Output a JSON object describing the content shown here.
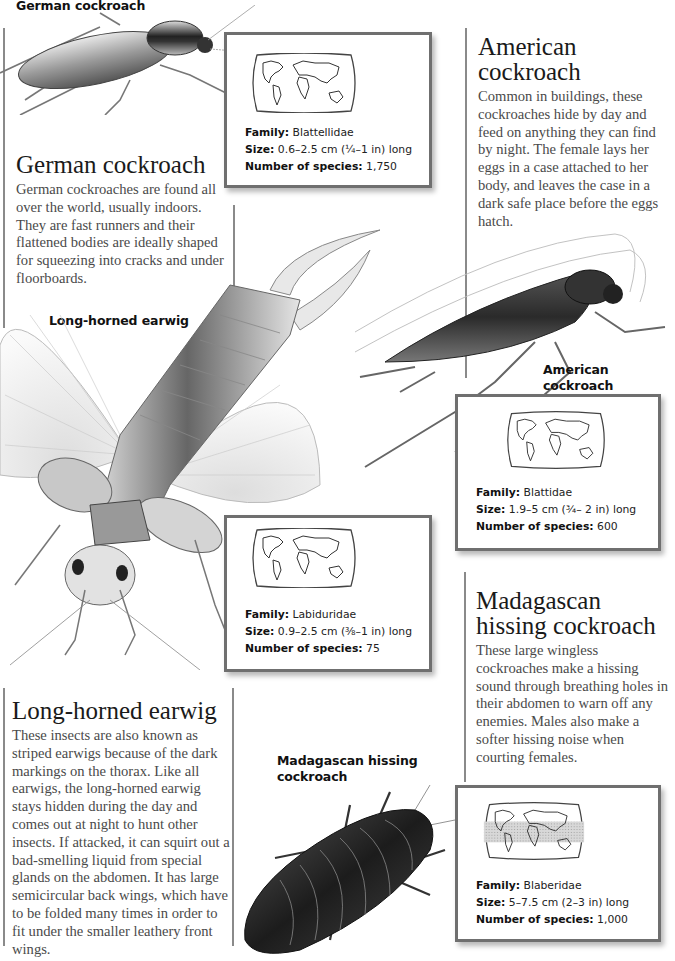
{
  "page": {
    "background": "#ffffff",
    "rule_color": "#8a8a8a",
    "box_border_color": "#6f6f6f"
  },
  "species": [
    {
      "id": "german-cockroach",
      "illustration_label": "German cockroach",
      "heading": "German cockroach",
      "description": "German cockroaches are found all over the world, usually indoors. They are fast runners and their flattened bodies are ideally shaped for squeezing into cracks and under floorboards.",
      "facts": {
        "family_label": "Family:",
        "family": "Blattellidae",
        "size_label": "Size:",
        "size": "0.6–2.5 cm (¼–1 in) long",
        "species_label": "Number of species:",
        "species_count": "1,750"
      },
      "map_icon": "world-map-icon"
    },
    {
      "id": "american-cockroach",
      "illustration_label": "American cockroach",
      "heading_line1": "American",
      "heading_line2": "cockroach",
      "description": "Common in buildings, these cockroaches hide by day and feed on anything they can find by night. The female lays her eggs in a case attached to her body, and leaves the case in a dark safe place before the eggs hatch.",
      "facts": {
        "family_label": "Family:",
        "family": "Blattidae",
        "size_label": "Size:",
        "size": "1.9–5 cm (¾– 2 in) long",
        "species_label": "Number of species:",
        "species_count": "600"
      },
      "map_icon": "world-map-icon"
    },
    {
      "id": "long-horned-earwig",
      "illustration_label": "Long-horned earwig",
      "heading": "Long-horned earwig",
      "description": "These insects are also known as striped earwigs because of the dark markings on the thorax. Like all earwigs, the long-horned earwig stays hidden during the day and comes out at night to hunt other insects. If attacked, it can squirt out a bad-smelling liquid from special glands on the abdomen. It has large semicircular back wings, which have to be folded many times in order to fit under the smaller leathery front wings.",
      "facts": {
        "family_label": "Family:",
        "family": "Labiduridae",
        "size_label": "Size:",
        "size": "0.9–2.5 cm (⅜–1 in) long",
        "species_label": "Number of species:",
        "species_count": "75"
      },
      "map_icon": "world-map-icon"
    },
    {
      "id": "madagascan-hissing-cockroach",
      "illustration_label_line1": "Madagascan hissing",
      "illustration_label_line2": "cockroach",
      "heading_line1": "Madagascan",
      "heading_line2": "hissing cockroach",
      "description": "These large wingless cockroaches make a hissing sound through breathing holes in their abdomen to warn off any enemies. Males also make a softer hissing noise when courting females.",
      "facts": {
        "family_label": "Family:",
        "family": "Blaberidae",
        "size_label": "Size:",
        "size": "5–7.5 cm (2–3 in) long",
        "species_label": "Number of species:",
        "species_count": "1,000"
      },
      "map_icon": "world-map-tropical-band-icon"
    }
  ]
}
